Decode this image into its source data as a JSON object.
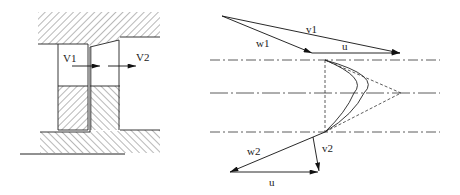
{
  "left_figure": {
    "title": "stage-cross-section",
    "labels": {
      "v1": "V1",
      "v2": "V2"
    }
  },
  "right_figure": {
    "title": "velocity-triangles",
    "labels": {
      "v1": "v1",
      "w1": "w1",
      "u_top": "u",
      "w2": "w2",
      "v2": "v2",
      "u_bottom": "u"
    }
  },
  "colors": {
    "line": "#222222",
    "hatch": "#333333",
    "background": "#ffffff"
  }
}
